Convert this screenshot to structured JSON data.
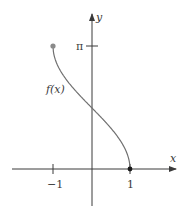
{
  "chart_data": {
    "type": "line",
    "title": "",
    "function_label": "f(x)",
    "xlabel": "x",
    "ylabel": "y",
    "x_ticks": [
      {
        "value": -1,
        "label": "−1"
      },
      {
        "value": 1,
        "label": "1"
      }
    ],
    "y_ticks": [
      {
        "value": 3.14159,
        "label": "π"
      }
    ],
    "series": [
      {
        "name": "f(x)",
        "function": "arccos(x)",
        "x": [
          -1,
          -0.75,
          -0.5,
          -0.25,
          0,
          0.25,
          0.5,
          0.75,
          1
        ],
        "y": [
          3.1416,
          2.4189,
          2.0944,
          1.8235,
          1.5708,
          1.3181,
          1.0472,
          0.7227,
          0
        ]
      }
    ],
    "endpoints": [
      {
        "x": -1,
        "y": 3.1416,
        "style": "filled-dot-gray"
      },
      {
        "x": 1,
        "y": 0,
        "style": "filled-dot-black"
      }
    ],
    "xlim": [
      -1.5,
      1.15
    ],
    "ylim": [
      -1.2,
      3.9
    ],
    "grid": false,
    "legend": "none",
    "colors": {
      "curve": "#707070",
      "axis": "#3a3a3a",
      "start_dot": "#8a8a8a",
      "end_dot": "#1a1a1a"
    }
  }
}
